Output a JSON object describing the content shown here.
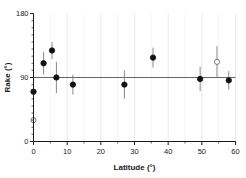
{
  "chart_data": {
    "type": "scatter",
    "title": "",
    "xlabel": "Latitude (°)",
    "ylabel": "Rake (°)",
    "xlim": [
      0,
      60
    ],
    "ylim": [
      0,
      180
    ],
    "x_ticks": [
      0,
      10,
      20,
      30,
      40,
      50,
      60
    ],
    "x_tick_labels": [
      "0",
      "10",
      "20",
      "30",
      "40",
      "50",
      "60"
    ],
    "y_ticks": [
      0,
      90,
      180
    ],
    "y_tick_labels": [
      "0",
      "90",
      "180"
    ],
    "grid": "vertical-light",
    "legend": "none",
    "reference_line_y": 90,
    "marker_styles": {
      "filled": "filled-circle-black",
      "open": "open-circle-grey"
    },
    "points": [
      {
        "x": 0.0,
        "y": 70,
        "yerr_low": 8,
        "yerr_high": 8,
        "style": "filled"
      },
      {
        "x": 0.0,
        "y": 30,
        "yerr_low": 4,
        "yerr_high": 4,
        "style": "open"
      },
      {
        "x": 3.0,
        "y": 110,
        "yerr_low": 16,
        "yerr_high": 16,
        "style": "filled"
      },
      {
        "x": 5.5,
        "y": 128,
        "yerr_low": 12,
        "yerr_high": 12,
        "style": "filled"
      },
      {
        "x": 6.8,
        "y": 90,
        "yerr_low": 22,
        "yerr_high": 22,
        "style": "filled"
      },
      {
        "x": 11.7,
        "y": 80,
        "yerr_low": 14,
        "yerr_high": 14,
        "style": "filled"
      },
      {
        "x": 27.0,
        "y": 80,
        "yerr_low": 20,
        "yerr_high": 20,
        "style": "filled"
      },
      {
        "x": 35.5,
        "y": 118,
        "yerr_low": 14,
        "yerr_high": 14,
        "style": "filled"
      },
      {
        "x": 49.5,
        "y": 88,
        "yerr_low": 17,
        "yerr_high": 17,
        "style": "filled"
      },
      {
        "x": 54.5,
        "y": 112,
        "yerr_low": 22,
        "yerr_high": 22,
        "style": "open"
      },
      {
        "x": 58.0,
        "y": 86,
        "yerr_low": 13,
        "yerr_high": 13,
        "style": "filled"
      }
    ]
  }
}
